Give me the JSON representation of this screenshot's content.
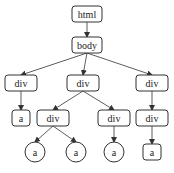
{
  "diagram": {
    "nodes": [
      {
        "id": "html",
        "label": "html",
        "shape": "rect",
        "x": 87,
        "y": 14
      },
      {
        "id": "body",
        "label": "body",
        "shape": "rect",
        "x": 87,
        "y": 45
      },
      {
        "id": "div1",
        "label": "div",
        "shape": "rect",
        "x": 21,
        "y": 83
      },
      {
        "id": "div2",
        "label": "div",
        "shape": "rect",
        "x": 83,
        "y": 83
      },
      {
        "id": "div3",
        "label": "div",
        "shape": "rect",
        "x": 152,
        "y": 83
      },
      {
        "id": "a1",
        "label": "a",
        "shape": "rect",
        "x": 21,
        "y": 118
      },
      {
        "id": "div4",
        "label": "div",
        "shape": "rect",
        "x": 53,
        "y": 118
      },
      {
        "id": "div5",
        "label": "div",
        "shape": "rect",
        "x": 114,
        "y": 118
      },
      {
        "id": "div6",
        "label": "div",
        "shape": "rect",
        "x": 152,
        "y": 118
      },
      {
        "id": "a2",
        "label": "a",
        "shape": "circle",
        "x": 35,
        "y": 152
      },
      {
        "id": "a3",
        "label": "a",
        "shape": "circle",
        "x": 76,
        "y": 152
      },
      {
        "id": "a4",
        "label": "a",
        "shape": "circle",
        "x": 114,
        "y": 152
      },
      {
        "id": "a5",
        "label": "a",
        "shape": "rect",
        "x": 152,
        "y": 152
      }
    ],
    "edges": [
      [
        "html",
        "body"
      ],
      [
        "body",
        "div1"
      ],
      [
        "body",
        "div2"
      ],
      [
        "body",
        "div3"
      ],
      [
        "div1",
        "a1"
      ],
      [
        "div2",
        "div4"
      ],
      [
        "div2",
        "div5"
      ],
      [
        "div3",
        "div6"
      ],
      [
        "div4",
        "a2"
      ],
      [
        "div4",
        "a3"
      ],
      [
        "div5",
        "a4"
      ],
      [
        "div6",
        "a5"
      ]
    ],
    "colors": {
      "stroke": "#333333",
      "text": "#222222",
      "background": "#ffffff"
    }
  }
}
